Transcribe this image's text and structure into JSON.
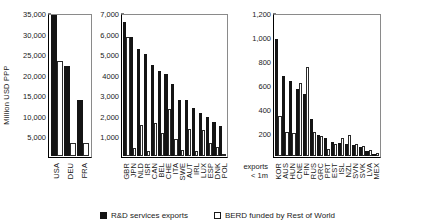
{
  "chart_data": {
    "type": "bar",
    "title": "",
    "subtitle": "",
    "xlabel": "",
    "ylabel": "Million USD PPP",
    "grid": false,
    "legend_position": "bottom-center",
    "series_names": [
      "R&D services exports",
      "BERD funded by Rest of World"
    ],
    "annotation": "exports\n< 1m",
    "annotation_line1": "exports",
    "annotation_line2": "< 1m",
    "panels": [
      {
        "name": "panel-high",
        "ylim": [
          0,
          35000
        ],
        "yticks": [
          5000,
          10000,
          15000,
          20000,
          25000,
          30000,
          35000
        ],
        "ytick_labels": [
          "5,000",
          "10,000",
          "15,000",
          "20,000",
          "25,000",
          "30,000",
          "35,000"
        ],
        "categories": [
          "USA",
          "DEU",
          "FRA"
        ],
        "series": [
          {
            "name": "R&D services exports",
            "values": [
              34800,
              22100,
              13800
            ]
          },
          {
            "name": "BERD funded by Rest of World",
            "values": [
              23300,
              3100,
              3200
            ]
          }
        ]
      },
      {
        "name": "panel-mid",
        "ylim": [
          0,
          7000
        ],
        "yticks": [
          1000,
          2000,
          3000,
          4000,
          5000,
          6000,
          7000
        ],
        "ytick_labels": [
          "1,000",
          "2,000",
          "3,000",
          "4000",
          "5,000",
          "6,000",
          "7,000"
        ],
        "categories": [
          "GBR",
          "JPN",
          "NLD",
          "ISR",
          "CAN",
          "BEL",
          "CHE",
          "ITA",
          "SWE",
          "AUT",
          "IRL",
          "LUX",
          "ESP",
          "DNK",
          "POL"
        ],
        "series": [
          {
            "name": "R&D services exports",
            "values": [
              6600,
              5880,
              5300,
              5050,
              4480,
              4200,
              4020,
              3560,
              2780,
              2760,
              2360,
              2130,
              1900,
              1700,
              1480
            ]
          },
          {
            "name": "BERD funded by Rest of World",
            "values": [
              5880,
              380,
              1530,
              260,
              1640,
              1150,
              2340,
              820,
              310,
              1320,
              250,
              1260,
              640,
              430,
              120
            ]
          }
        ]
      },
      {
        "name": "panel-low",
        "ylim": [
          0,
          1200
        ],
        "yticks": [
          200,
          400,
          600,
          800,
          1000,
          1200
        ],
        "ytick_labels": [
          "200",
          "400",
          "600",
          "800",
          "1,000",
          "1,200"
        ],
        "categories": [
          "KOR",
          "AUS",
          "HUN",
          "CNE",
          "FIN",
          "RUS",
          "GRC",
          "PRT",
          "EST",
          "ISL",
          "NZL",
          "SVN",
          "SVK",
          "LVA",
          "MEX"
        ],
        "series": [
          {
            "name": "R&D services exports",
            "values": [
              990,
              675,
              630,
              565,
              520,
              315,
              180,
              150,
              115,
              110,
              105,
              95,
              75,
              40,
              20
            ]
          },
          {
            "name": "BERD funded by Rest of World",
            "values": [
              340,
              200,
              195,
              620,
              755,
              200,
              170,
              60,
              100,
              150,
              180,
              100,
              85,
              55,
              25
            ]
          }
        ]
      }
    ]
  }
}
